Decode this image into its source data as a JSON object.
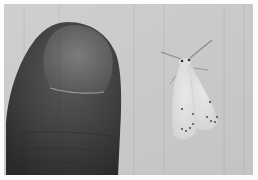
{
  "image": {
    "alt": "Grayscale photo of a thumb next to a small pale moth for size comparison",
    "subjects": [
      {
        "name": "thumb",
        "position": "left"
      },
      {
        "name": "moth",
        "position": "right"
      }
    ],
    "colors": {
      "border": "#fdfdfd",
      "background": "#c9c9c9",
      "thumb_skin": "#3f3f3f",
      "thumb_nail": "#6a6a6a",
      "moth_body": "#e2e2e2",
      "moth_spots": "#3a3a3a"
    }
  }
}
